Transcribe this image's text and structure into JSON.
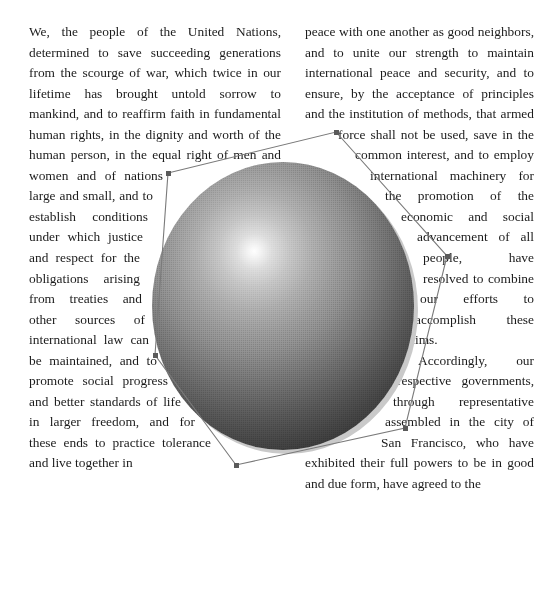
{
  "document": {
    "title": "Charter of the United Nations — Preamble",
    "typeface_style": "serif",
    "columns": 2,
    "text_align": "justify"
  },
  "colors": {
    "page_background": "#ffffff",
    "body_text": "#1b1b1b",
    "wrap_outline": "#7a7a7a",
    "wrap_vertex_handle": "#5a5a5a",
    "sphere_highlight": "#ffffff",
    "sphere_midtone": "#808080",
    "sphere_shadow_core": "#1a1a1a",
    "drop_shadow": "#c9c9c9"
  },
  "left_column": {
    "paragraphs": [
      "We, the people of the United Nations, determined to save succeeding generations from the scourge of war, which twice in our lifetime has brought untold sorrow to mankind, and to reaffirm faith in fundamental human rights, in the dignity and worth of the human person, in the equal right of men and women and of nations large and small, and to establish conditions under which justice and respect for the obligations arising from treaties and other sources of international law can be maintained, and to promote social progress and better standards of life in larger freedom, and for these ends to practice tolerance and live together in"
    ]
  },
  "right_column": {
    "paragraphs": [
      "peace with one another as good neighbors, and to unite our strength to maintain international peace and security, and to ensure, by the acceptance of principles and the institution of methods, that armed force shall not be used, save in the common interest, and to employ international machinery for the promotion of the economic and social advancement of all people, have resolved to combine our efforts to accomplish these aims.",
      "Accordingly, our respective governments, through representative assembled in the city of San Francisco, who have exhibited their full powers to be in good and due form, have agreed to the"
    ]
  },
  "artwork": {
    "sphere": {
      "label": "shaded-sphere",
      "center_x": 283,
      "center_y": 306,
      "radius_x": 131,
      "radius_y": 144,
      "highlight_x": 255,
      "highlight_y": 251,
      "has_drop_shadow": true
    },
    "wrap_polygon": {
      "label": "text-wrap-boundary",
      "stroke": "#7a7a7a",
      "vertices": [
        {
          "x": 168,
          "y": 173
        },
        {
          "x": 336,
          "y": 132
        },
        {
          "x": 447,
          "y": 256
        },
        {
          "x": 405,
          "y": 428
        },
        {
          "x": 236,
          "y": 465
        },
        {
          "x": 155,
          "y": 355
        }
      ]
    }
  }
}
